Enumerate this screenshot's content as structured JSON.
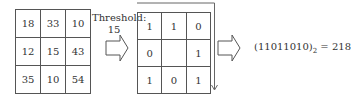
{
  "input_grid": {
    "rows": [
      [
        "18",
        "33",
        "10"
      ],
      [
        "12",
        "15",
        "43"
      ],
      [
        "35",
        "10",
        "54"
      ]
    ]
  },
  "threshold": {
    "label": "Threshold:",
    "value": "15"
  },
  "binary_grid": {
    "rows": [
      [
        "1",
        "1",
        "0"
      ],
      [
        "0",
        "",
        "1"
      ],
      [
        "1",
        "0",
        "1"
      ]
    ]
  },
  "result": {
    "binary": "(11011010)",
    "base": "2",
    "equals": " = 218"
  },
  "colors": {
    "line": "#555555",
    "text": "#333333"
  }
}
